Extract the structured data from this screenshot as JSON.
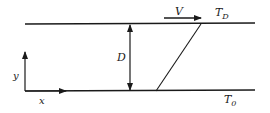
{
  "diagram": {
    "type": "couette-flow-schematic",
    "labels": {
      "velocity": "V",
      "top_temperature_main": "T",
      "top_temperature_sub": "D",
      "bottom_temperature_main": "T",
      "bottom_temperature_sub": "0",
      "gap": "D",
      "x_axis": "x",
      "y_axis": "y"
    },
    "colors": {
      "line": "#1a1a1a",
      "background": "#ffffff"
    }
  }
}
